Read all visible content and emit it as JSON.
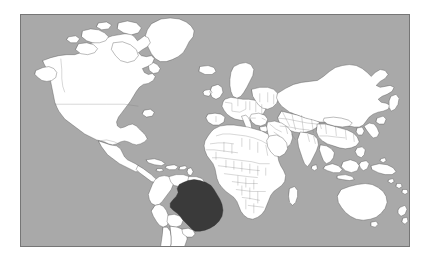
{
  "figure": {
    "type": "choropleth-world-map",
    "title": "",
    "projection": "equirectangular",
    "background_color": "#ffffff"
  },
  "map": {
    "ocean_color": "#a9a9a9",
    "land_color": "#ffffff",
    "land_border_color": "#4a4a4a",
    "country_border_color": "#7a7a7a",
    "frame_color": "#767676",
    "highlight_color": "#3a3a3a",
    "highlighted_countries": [
      "Brazil"
    ],
    "frame": {
      "left": 20,
      "top": 14,
      "width": 390,
      "height": 233
    },
    "regions": [
      {
        "name": "North America",
        "label": "north-america"
      },
      {
        "name": "South America",
        "label": "south-america"
      },
      {
        "name": "Europe",
        "label": "europe"
      },
      {
        "name": "Africa",
        "label": "africa"
      },
      {
        "name": "Asia",
        "label": "asia"
      },
      {
        "name": "Oceania",
        "label": "oceania"
      },
      {
        "name": "Greenland",
        "label": "greenland"
      }
    ]
  },
  "legend": {
    "visible": false,
    "entries": []
  },
  "annotations": []
}
